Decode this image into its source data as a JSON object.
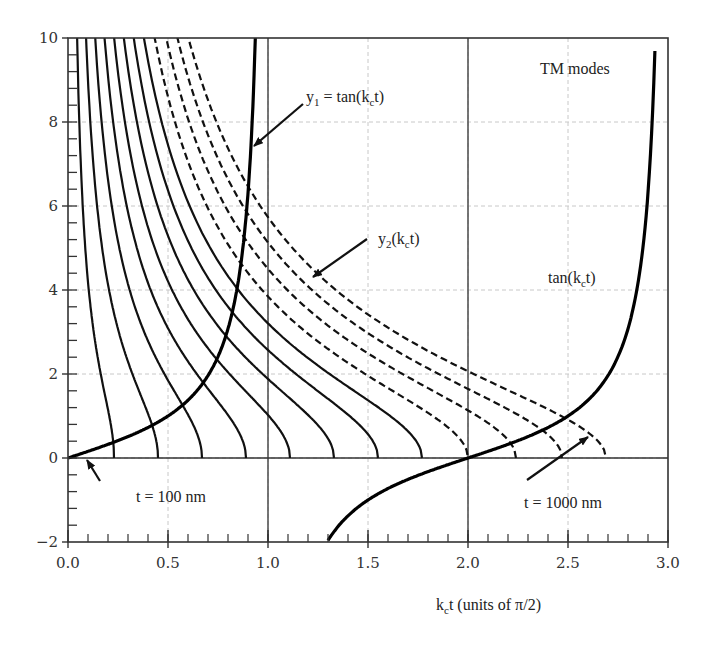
{
  "chart_data": {
    "type": "line",
    "title": "",
    "xlabel": "k_c t (units of π/2)",
    "xlabel_main": "k",
    "xlabel_sub": "c",
    "xlabel_rest": "t (units of π/2)",
    "ylabel": "",
    "xlim": [
      0.0,
      3.0
    ],
    "ylim": [
      -2,
      10
    ],
    "x_ticks": [
      "0.0",
      "0.5",
      "1.0",
      "1.5",
      "2.0",
      "2.5",
      "3.0"
    ],
    "y_ticks": [
      "−2",
      "0",
      "2",
      "4",
      "6",
      "8",
      "10"
    ],
    "x_minor_step": 0.1,
    "y_minor_step": 0.4,
    "grid": "dashed light gray at major ticks; solid vertical lines at x=1.0 and x=2.0",
    "series": [
      {
        "name": "y1 = tan(k_c t)",
        "style": "thick solid",
        "function": "tan(πx/2)",
        "branches": [
          [
            0.0,
            0.94
          ],
          [
            1.3,
            2.94
          ]
        ]
      },
      {
        "name": "y2(k_c t), t = 100 nm",
        "style": "solid",
        "zero_at": 0.23,
        "y_at_top_x": 0.045
      },
      {
        "name": "y2(k_c t)",
        "style": "solid",
        "zero_at": 0.45
      },
      {
        "name": "y2(k_c t)",
        "style": "solid",
        "zero_at": 0.67
      },
      {
        "name": "y2(k_c t)",
        "style": "solid",
        "zero_at": 0.89
      },
      {
        "name": "y2(k_c t)",
        "style": "solid",
        "zero_at": 1.11
      },
      {
        "name": "y2(k_c t)",
        "style": "solid",
        "zero_at": 1.33
      },
      {
        "name": "y2(k_c t)",
        "style": "solid",
        "zero_at": 1.55
      },
      {
        "name": "y2(k_c t)",
        "style": "solid",
        "zero_at": 1.77
      },
      {
        "name": "y2(k_c t)",
        "style": "dashed",
        "zero_at": 2.0
      },
      {
        "name": "y2(k_c t)",
        "style": "dashed",
        "zero_at": 2.24
      },
      {
        "name": "y2(k_c t)",
        "style": "dashed",
        "zero_at": 2.47
      },
      {
        "name": "y2(k_c t), t = 1000 nm",
        "style": "dashed",
        "zero_at": 2.69
      }
    ],
    "annotations": [
      {
        "text": "TM modes",
        "x": 2.5,
        "y": 9.0
      },
      {
        "text": "y1 = tan(kct)",
        "main": "y",
        "sub1": "1",
        "mid": " = tan(k",
        "sub2": "c",
        "end": "t)",
        "x": 1.3,
        "y": 9.1,
        "arrow_to": [
          0.93,
          7.3
        ]
      },
      {
        "text": "y2(kct)",
        "main": "y",
        "sub1": "2",
        "mid": "(k",
        "sub2": "c",
        "end": "t)",
        "x": 1.55,
        "y": 5.3,
        "arrow_to": [
          1.25,
          4.0
        ]
      },
      {
        "text": "tan(kct)",
        "main": "tan(k",
        "sub": "c",
        "end": "t)",
        "x": 2.3,
        "y": 3.9
      },
      {
        "text": "t = 100 nm",
        "x": 0.32,
        "y": -0.8,
        "arrow_to": [
          0.24,
          -0.05
        ]
      },
      {
        "text": "t = 1000 nm",
        "x": 2.25,
        "y": -0.9,
        "arrow_to": [
          2.58,
          0.35
        ]
      }
    ]
  }
}
